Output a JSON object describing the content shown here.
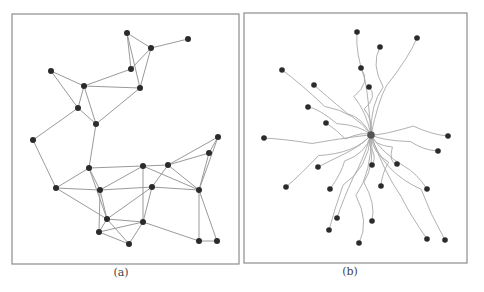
{
  "figure": {
    "panels": [
      {
        "id": "a",
        "caption": "(a)",
        "description": "Node-link graph with straight edges",
        "frame": {
          "x": 12,
          "y": 14,
          "w": 227,
          "h": 250
        },
        "nodes": {
          "A": [
            127,
            33
          ],
          "B": [
            151,
            48
          ],
          "C": [
            188,
            39
          ],
          "D": [
            131,
            69
          ],
          "E": [
            51,
            71
          ],
          "F": [
            84,
            86
          ],
          "G": [
            140,
            88
          ],
          "H": [
            78,
            108
          ],
          "I": [
            96,
            124
          ],
          "J": [
            33,
            140
          ],
          "K": [
            218,
            137
          ],
          "L": [
            209,
            153
          ],
          "M": [
            89,
            168
          ],
          "N": [
            143,
            166
          ],
          "O": [
            168,
            165
          ],
          "P": [
            56,
            188
          ],
          "Q": [
            100,
            190
          ],
          "R": [
            152,
            187
          ],
          "S": [
            199,
            190
          ],
          "T": [
            107,
            219
          ],
          "U": [
            143,
            222
          ],
          "V": [
            99,
            232
          ],
          "W": [
            129,
            244
          ],
          "X": [
            199,
            241
          ],
          "Y": [
            217,
            241
          ]
        },
        "edges": [
          [
            "A",
            "B"
          ],
          [
            "A",
            "D"
          ],
          [
            "A",
            "G"
          ],
          [
            "B",
            "C"
          ],
          [
            "B",
            "D"
          ],
          [
            "B",
            "G"
          ],
          [
            "D",
            "F"
          ],
          [
            "F",
            "G"
          ],
          [
            "E",
            "F"
          ],
          [
            "E",
            "H"
          ],
          [
            "F",
            "H"
          ],
          [
            "F",
            "I"
          ],
          [
            "H",
            "I"
          ],
          [
            "G",
            "I"
          ],
          [
            "H",
            "J"
          ],
          [
            "I",
            "M"
          ],
          [
            "J",
            "P"
          ],
          [
            "M",
            "P"
          ],
          [
            "M",
            "N"
          ],
          [
            "M",
            "Q"
          ],
          [
            "M",
            "T"
          ],
          [
            "P",
            "Q"
          ],
          [
            "P",
            "T"
          ],
          [
            "N",
            "O"
          ],
          [
            "N",
            "Q"
          ],
          [
            "N",
            "U"
          ],
          [
            "N",
            "S"
          ],
          [
            "O",
            "R"
          ],
          [
            "O",
            "S"
          ],
          [
            "O",
            "K"
          ],
          [
            "O",
            "L"
          ],
          [
            "K",
            "L"
          ],
          [
            "K",
            "S"
          ],
          [
            "L",
            "S"
          ],
          [
            "Q",
            "R"
          ],
          [
            "R",
            "S"
          ],
          [
            "R",
            "T"
          ],
          [
            "R",
            "U"
          ],
          [
            "Q",
            "T"
          ],
          [
            "Q",
            "V"
          ],
          [
            "T",
            "V"
          ],
          [
            "T",
            "U"
          ],
          [
            "T",
            "W"
          ],
          [
            "V",
            "U"
          ],
          [
            "V",
            "W"
          ],
          [
            "U",
            "W"
          ],
          [
            "U",
            "X"
          ],
          [
            "S",
            "X"
          ],
          [
            "S",
            "Y"
          ],
          [
            "X",
            "Y"
          ]
        ]
      },
      {
        "id": "b",
        "caption": "(b)",
        "description": "Star graph with bundled curved edges converging on a hub",
        "frame": {
          "x": 244,
          "y": 13,
          "w": 223,
          "h": 250
        },
        "hub": [
          371,
          135
        ],
        "nodes": [
          [
            357,
            32
          ],
          [
            417,
            38
          ],
          [
            380,
            47
          ],
          [
            282,
            70
          ],
          [
            361,
            68
          ],
          [
            314,
            85
          ],
          [
            369,
            87
          ],
          [
            308,
            107
          ],
          [
            326,
            123
          ],
          [
            264,
            138
          ],
          [
            448,
            136
          ],
          [
            438,
            151
          ],
          [
            318,
            167
          ],
          [
            372,
            165
          ],
          [
            397,
            164
          ],
          [
            286,
            187
          ],
          [
            381,
            186
          ],
          [
            330,
            189
          ],
          [
            427,
            189
          ],
          [
            337,
            218
          ],
          [
            372,
            221
          ],
          [
            329,
            230
          ],
          [
            359,
            243
          ],
          [
            427,
            239
          ],
          [
            445,
            240
          ]
        ]
      }
    ],
    "colors": {
      "node": "#2b2b2b",
      "hub": "#555555",
      "edge": "#9a9a9a",
      "curve": "#a8a8a8",
      "frame": "#8c8c8c",
      "caption": "#444444"
    }
  }
}
